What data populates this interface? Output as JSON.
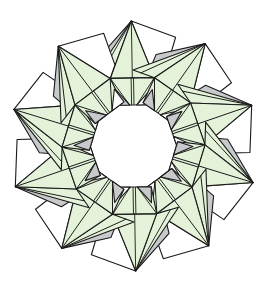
{
  "diagram": {
    "points": 10,
    "units": 10,
    "center": [
      133.5,
      146
    ],
    "tip_radius": 125,
    "hole_radius": 40,
    "colors": {
      "paper_front": "#e3f2d9",
      "paper_back": "#c8c9cb",
      "outline": "#1a1a1a",
      "background": "#ffffff"
    }
  }
}
